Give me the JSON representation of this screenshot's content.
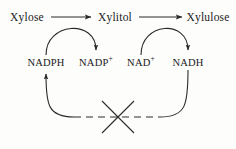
{
  "diagram": {
    "stroke_color": "#2b2b2b",
    "text_color": "#1a1a1a",
    "background_color": "#fdfdfc",
    "metabolites": [
      {
        "id": "xylose",
        "label": "Xylose",
        "x": 27,
        "y": 17
      },
      {
        "id": "xylitol",
        "label": "Xylitol",
        "x": 115,
        "y": 17
      },
      {
        "id": "xylulose",
        "label": "Xylulose",
        "x": 208,
        "y": 17
      }
    ],
    "cofactors": [
      {
        "id": "nadph",
        "label": "NADPH",
        "base": "NADPH",
        "charge": "",
        "x": 46,
        "y": 62
      },
      {
        "id": "nadp",
        "label": "NADP+",
        "base": "NADP",
        "charge": "+",
        "x": 96,
        "y": 62
      },
      {
        "id": "nad",
        "label": "NAD+",
        "base": "NAD",
        "charge": "+",
        "x": 141,
        "y": 62
      },
      {
        "id": "nadh",
        "label": "NADH",
        "base": "NADH",
        "charge": "",
        "x": 188,
        "y": 62
      }
    ],
    "reactions": [
      {
        "id": "xylose-to-xylitol",
        "from": "xylose",
        "to": "xylitol",
        "type": "arrow"
      },
      {
        "id": "xylitol-to-xylulose",
        "from": "xylitol",
        "to": "xylulose",
        "type": "arrow"
      }
    ],
    "cofactor_arcs": [
      {
        "id": "nadph-to-nadp-arc",
        "from": "nadph",
        "to": "nadp",
        "type": "curved-arrow"
      },
      {
        "id": "nad-to-nadh-arc",
        "from": "nad",
        "to": "nadh",
        "type": "curved-arrow"
      }
    ],
    "recycling_path": {
      "id": "nadh-to-nadph-recycle",
      "from": "nadh",
      "to": "nadph",
      "style": "dashed",
      "blocked": true,
      "block_marker": "x-cross",
      "block_x": 118,
      "block_y": 117
    }
  }
}
